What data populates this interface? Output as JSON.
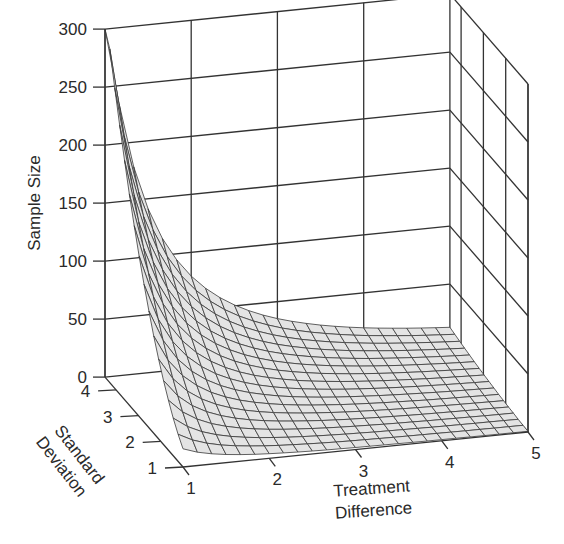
{
  "chart_data": {
    "type": "surface3d",
    "title": "",
    "zlabel": "Sample Size",
    "xlabel": "Treatment Difference",
    "ylabel": "Standard Deviation",
    "zlim": [
      0,
      300
    ],
    "xlim": [
      1,
      5
    ],
    "ylim": [
      1,
      4.5
    ],
    "z_ticks": [
      "0",
      "50",
      "100",
      "150",
      "200",
      "250",
      "300"
    ],
    "x_ticks": [
      "1",
      "2",
      "3",
      "4",
      "5"
    ],
    "y_ticks": [
      "1",
      "2",
      "3",
      "4"
    ],
    "formula": "n = 15.7 * sd^2 / diff^2 (clipped at 300)",
    "grid": true,
    "surface_fill": "#e4e4e4",
    "mesh_color": "#3a3a3a",
    "sample_points": [
      {
        "diff": 1,
        "sd": 1,
        "n": 16
      },
      {
        "diff": 1,
        "sd": 2,
        "n": 63
      },
      {
        "diff": 1,
        "sd": 3,
        "n": 141
      },
      {
        "diff": 1,
        "sd": 4,
        "n": 251
      },
      {
        "diff": 2,
        "sd": 4,
        "n": 63
      },
      {
        "diff": 3,
        "sd": 4,
        "n": 28
      },
      {
        "diff": 5,
        "sd": 4,
        "n": 10
      },
      {
        "diff": 5,
        "sd": 1,
        "n": 1
      }
    ]
  },
  "labels": {
    "z_axis_title": "Sample Size",
    "x_axis_title_line1": "Treatment",
    "x_axis_title_line2": "Difference",
    "y_axis_title_line1": "Standard",
    "y_axis_title_line2": "Deviation"
  }
}
